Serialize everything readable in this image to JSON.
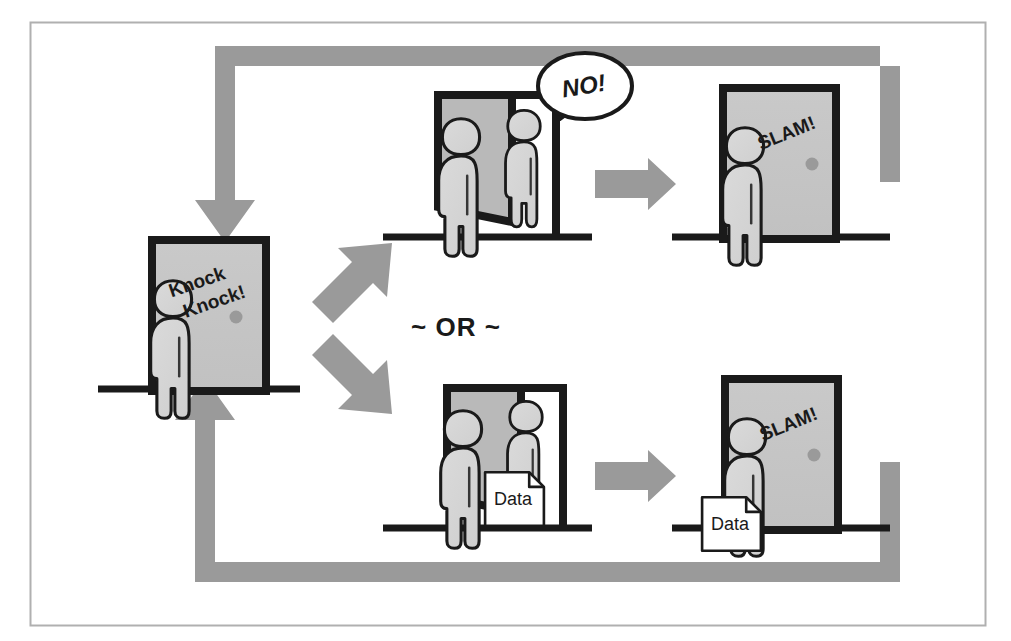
{
  "figure": {
    "type": "flow-diagram",
    "frame_color": "#b0b0b0",
    "palette": {
      "arrow_gray": "#9a9a9a",
      "door_fill": "#c6c6c6",
      "door_fill_shadow": "#b4b4b4",
      "person_fill": "#d6d6d6",
      "outline_black": "#1a1a1a",
      "paper_white": "#ffffff",
      "background": "#ffffff"
    }
  },
  "panels": [
    {
      "id": "knock",
      "name": "knock-panel",
      "door_state": "closed",
      "label": "Knock Knock!",
      "people": 1,
      "has_data_doc": false
    },
    {
      "id": "refused",
      "name": "refused-panel",
      "door_state": "open",
      "label": "NO!",
      "label_kind": "speech-bubble",
      "people": 2,
      "has_data_doc": false
    },
    {
      "id": "slam-refused",
      "name": "slam-refused-panel",
      "door_state": "closed",
      "label": "SLAM!",
      "people": 1,
      "has_data_doc": false
    },
    {
      "id": "granted",
      "name": "granted-panel",
      "door_state": "open",
      "label": "Data",
      "label_kind": "document",
      "people": 2,
      "has_data_doc": true
    },
    {
      "id": "slam-granted",
      "name": "slam-granted-panel",
      "door_state": "closed",
      "label": "SLAM!",
      "secondary_label": "Data",
      "people": 1,
      "has_data_doc": true
    }
  ],
  "labels": {
    "knock_knock_line1": "Knock",
    "knock_knock_line2": "Knock!",
    "no_bubble": "NO!",
    "slam_top": "SLAM!",
    "slam_bottom": "SLAM!",
    "or_divider": "~ OR ~",
    "data_doc_middle": "Data",
    "data_doc_right": "Data"
  },
  "connectors": [
    {
      "name": "branch-arrow-up",
      "kind": "diagonal-arrow",
      "direction": "up-right",
      "from": "knock",
      "to": "refused"
    },
    {
      "name": "branch-arrow-down",
      "kind": "diagonal-arrow",
      "direction": "down-right",
      "from": "knock",
      "to": "granted"
    },
    {
      "name": "advance-arrow-top",
      "kind": "straight-arrow",
      "direction": "right",
      "from": "refused",
      "to": "slam-refused"
    },
    {
      "name": "advance-arrow-bottom",
      "kind": "straight-arrow",
      "direction": "right",
      "from": "granted",
      "to": "slam-granted"
    },
    {
      "name": "loop-arrow-top",
      "kind": "loop-arrow",
      "direction": "counter-clockwise",
      "from": "slam-refused",
      "to": "knock"
    },
    {
      "name": "loop-arrow-bottom",
      "kind": "loop-arrow",
      "direction": "clockwise",
      "from": "slam-granted",
      "to": "knock"
    }
  ]
}
